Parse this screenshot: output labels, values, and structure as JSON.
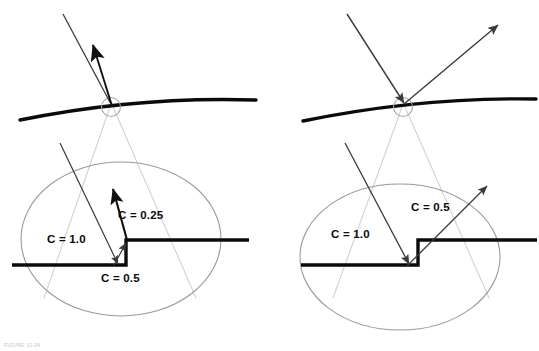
{
  "figure": {
    "caption": "FIGURE 11-24",
    "panels": [
      {
        "id": "left-panel",
        "name": "left-panel",
        "surface_label": "curved-surface",
        "hit_marker_label": "intersection-circle",
        "labels": [
          {
            "id": "c-1-0",
            "text": "C = 1.0",
            "x": 47,
            "y": 243
          },
          {
            "id": "c-0-25",
            "text": "C = 0.25",
            "x": 118,
            "y": 219
          },
          {
            "id": "c-0-5",
            "text": "C = 0.5",
            "x": 101,
            "y": 282
          }
        ],
        "rays": {
          "incoming_top": {
            "from": [
              63,
              14
            ],
            "to": [
              112,
              106
            ]
          },
          "outgoing_top": {
            "from": [
              112,
              106
            ],
            "to": [
              92,
              42
            ]
          },
          "incoming_lower": {
            "from": [
              60,
              143
            ],
            "to": [
              117,
              263
            ]
          },
          "outgoing_lower_small": {
            "from": [
              116,
              265
            ],
            "to": [
              128,
              243
            ]
          },
          "outgoing_lower_long": {
            "from": [
              127,
              241
            ],
            "to": [
              113,
              189
            ]
          }
        }
      },
      {
        "id": "right-panel",
        "name": "right-panel",
        "surface_label": "curved-surface",
        "hit_marker_label": "intersection-circle",
        "labels": [
          {
            "id": "c-1-0",
            "text": "C = 1.0",
            "x": 331,
            "y": 238
          },
          {
            "id": "c-0-5",
            "text": "C = 0.5",
            "x": 411,
            "y": 211
          }
        ],
        "rays": {
          "incoming_top": {
            "from": [
              347,
              14
            ],
            "to": [
              404,
              104
            ]
          },
          "outgoing_top": {
            "from": [
              404,
              104
            ],
            "to": [
              498,
              25
            ]
          },
          "incoming_lower": {
            "from": [
              345,
              143
            ],
            "to": [
              408,
              265
            ]
          },
          "outgoing_lower": {
            "from": [
              408,
              265
            ],
            "to": [
              487,
              186
            ]
          }
        }
      }
    ],
    "colors": {
      "ink": "#0b0b0b",
      "ray": "#3a3a3a",
      "cone": "#cfcfcf",
      "ellipse": "#9a9a9a",
      "caption": "#d2d2d2",
      "background": "#ffffff"
    }
  }
}
